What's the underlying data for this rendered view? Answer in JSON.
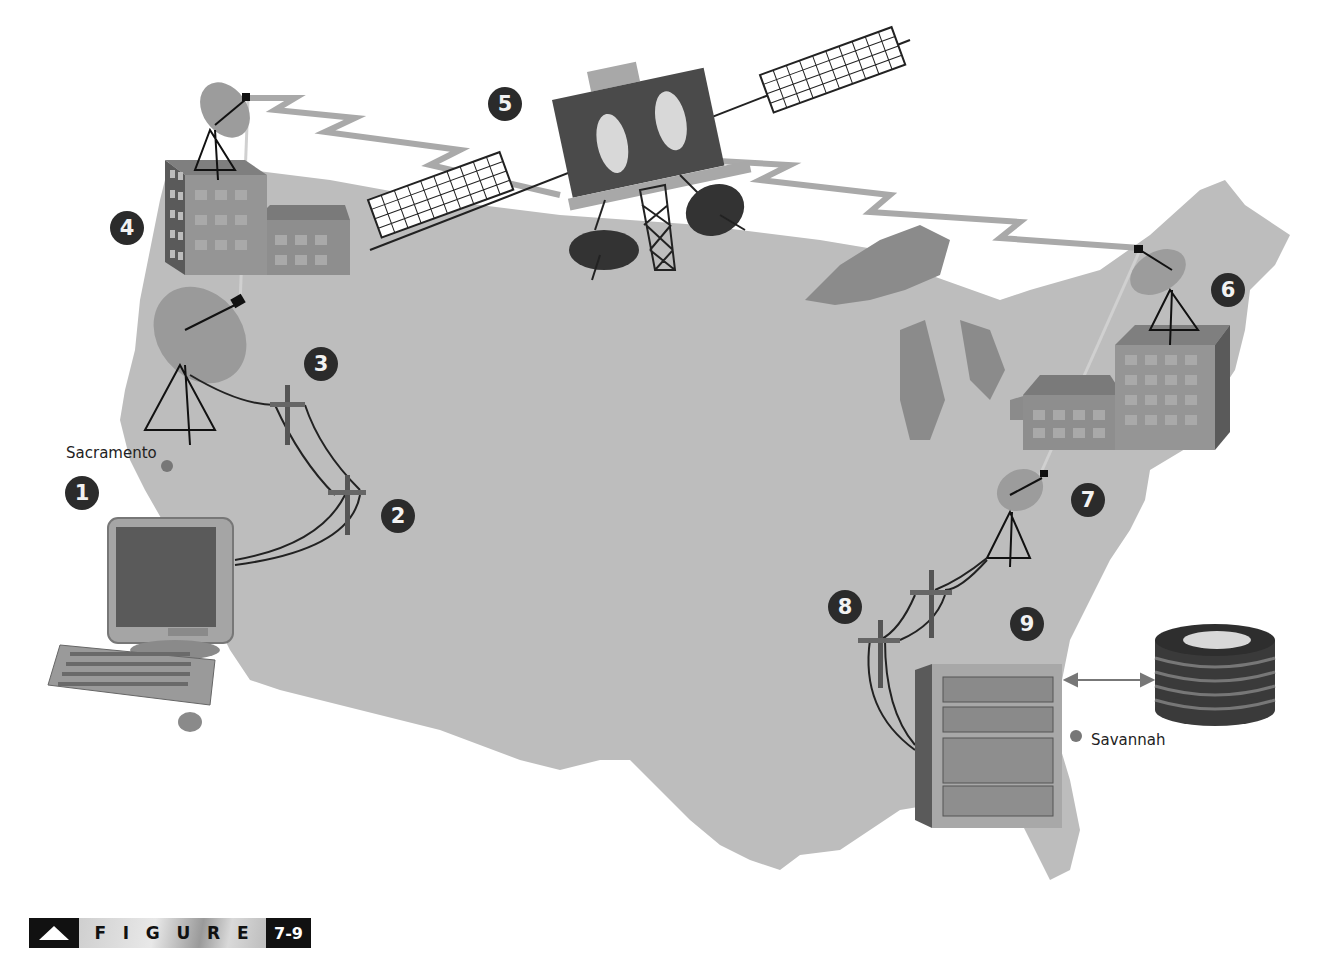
{
  "figure": {
    "label_word": [
      "F",
      "I",
      "G",
      "U",
      "R",
      "E"
    ],
    "number": "7-9"
  },
  "cities": {
    "origin": "Sacramento",
    "destination": "Savannah"
  },
  "steps": [
    {
      "n": "1",
      "label": "User computer in Sacramento"
    },
    {
      "n": "2",
      "label": "Telephone line pole"
    },
    {
      "n": "3",
      "label": "Telephone line pole near earth station"
    },
    {
      "n": "4",
      "label": "Earth station building (west)"
    },
    {
      "n": "5",
      "label": "Communications satellite"
    },
    {
      "n": "6",
      "label": "Earth station building (east)"
    },
    {
      "n": "7",
      "label": "Receiving dish"
    },
    {
      "n": "8",
      "label": "Telephone line poles"
    },
    {
      "n": "9",
      "label": "Host computer in Savannah"
    }
  ],
  "colors": {
    "map": "#b9b9b9",
    "lakes": "#8a8a8a",
    "building": "#8e8e8e",
    "dark": "#2b2b2b",
    "signal": "#a9a9a9"
  }
}
